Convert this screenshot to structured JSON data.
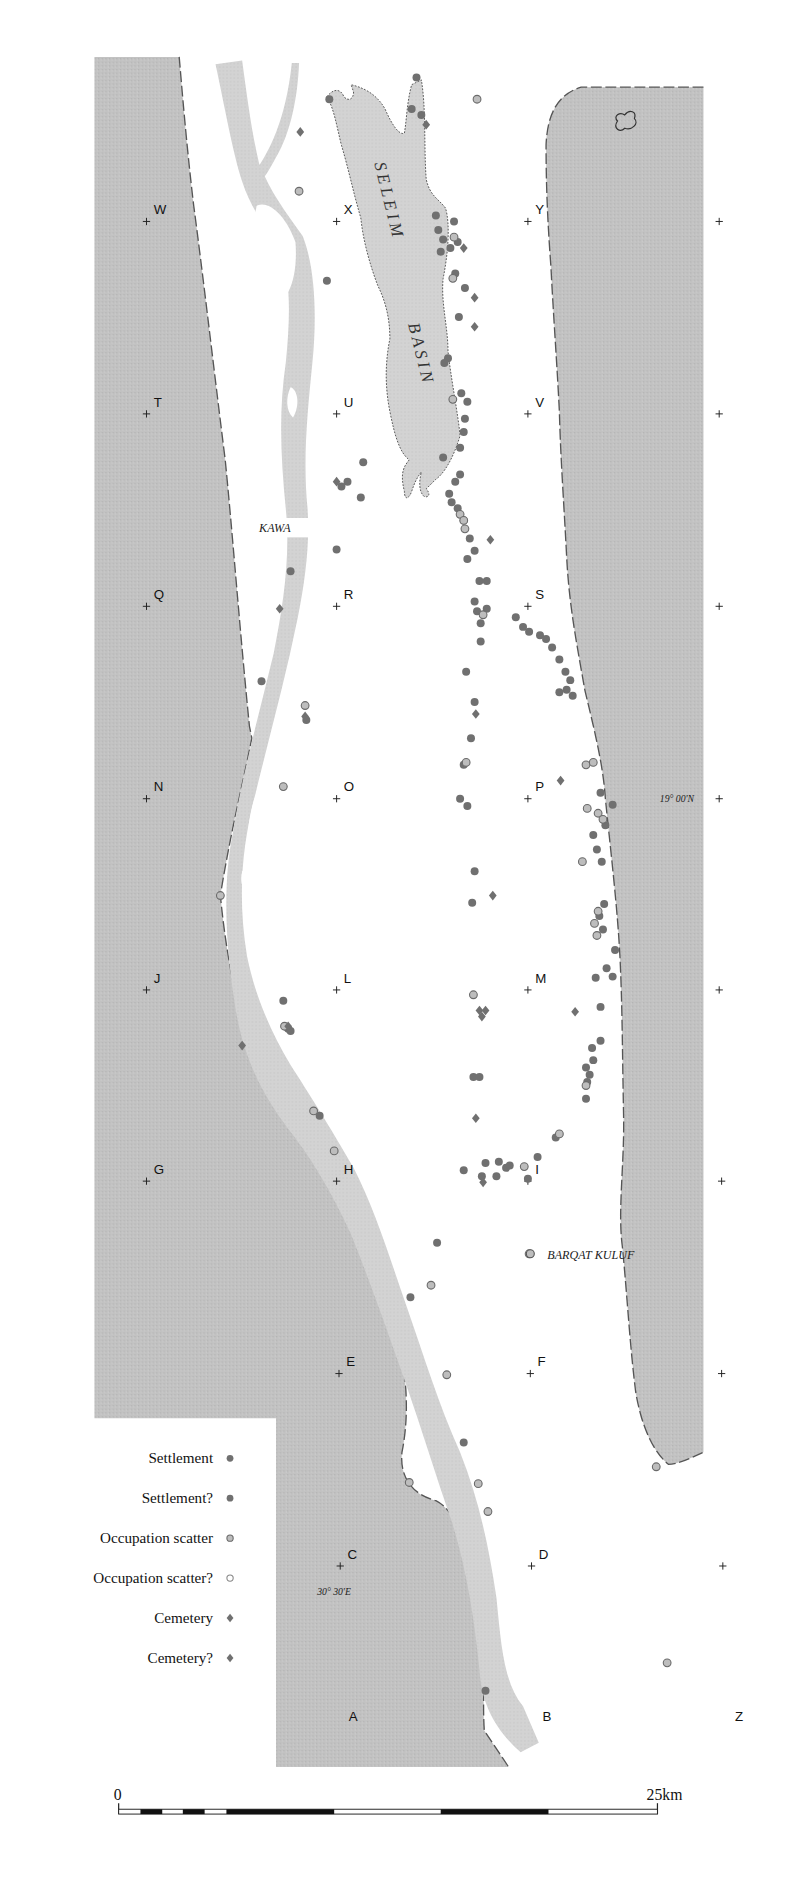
{
  "map": {
    "region_labels": {
      "basin_word1": "SELEIM",
      "basin_word2": "BASIN",
      "kawa": "KAWA",
      "barqat_kuluf": "BARQAT KULUF",
      "latitude": "19°  00'N",
      "longitude": "30°  30'E"
    },
    "grid_points": [
      {
        "id": "W",
        "x": 121,
        "y": 183
      },
      {
        "id": "X",
        "x": 278,
        "y": 183
      },
      {
        "id": "Y",
        "x": 436,
        "y": 183
      },
      {
        "id": "T",
        "x": 121,
        "y": 342
      },
      {
        "id": "U",
        "x": 278,
        "y": 342
      },
      {
        "id": "V",
        "x": 436,
        "y": 342
      },
      {
        "id": "Q",
        "x": 121,
        "y": 501
      },
      {
        "id": "R",
        "x": 278,
        "y": 501
      },
      {
        "id": "S",
        "x": 436,
        "y": 501
      },
      {
        "id": "N",
        "x": 121,
        "y": 660
      },
      {
        "id": "O",
        "x": 278,
        "y": 660
      },
      {
        "id": "P",
        "x": 436,
        "y": 660
      },
      {
        "id": "J",
        "x": 121,
        "y": 818
      },
      {
        "id": "L",
        "x": 278,
        "y": 818
      },
      {
        "id": "M",
        "x": 436,
        "y": 818
      },
      {
        "id": "G",
        "x": 121,
        "y": 976
      },
      {
        "id": "H",
        "x": 278,
        "y": 976
      },
      {
        "id": "I",
        "x": 436,
        "y": 976
      },
      {
        "id": "E",
        "x": 280,
        "y": 1135
      },
      {
        "id": "F",
        "x": 438,
        "y": 1135
      },
      {
        "id": "C",
        "x": 281,
        "y": 1294
      },
      {
        "id": "D",
        "x": 439,
        "y": 1294
      },
      {
        "id": "A",
        "x": 292,
        "y": 1418,
        "nocross": true
      },
      {
        "id": "B",
        "x": 452,
        "y": 1418,
        "nocross": true
      },
      {
        "id": "Z",
        "x": 611,
        "y": 1418,
        "nocross": true
      }
    ],
    "edge_crosses": [
      {
        "x": 594,
        "y": 183
      },
      {
        "x": 594,
        "y": 342
      },
      {
        "x": 594,
        "y": 501
      },
      {
        "x": 594,
        "y": 660
      },
      {
        "x": 594,
        "y": 818
      },
      {
        "x": 596,
        "y": 976
      },
      {
        "x": 596,
        "y": 1135
      },
      {
        "x": 597,
        "y": 1294
      }
    ],
    "sites": {
      "settlement": [
        [
          344,
          64
        ],
        [
          340,
          90
        ],
        [
          348,
          95
        ],
        [
          272,
          82
        ],
        [
          360,
          178
        ],
        [
          375,
          183
        ],
        [
          362,
          190
        ],
        [
          366,
          198
        ],
        [
          372,
          205
        ],
        [
          378,
          200
        ],
        [
          364,
          208
        ],
        [
          376,
          226
        ],
        [
          384,
          238
        ],
        [
          379,
          262
        ],
        [
          370,
          296
        ],
        [
          367,
          300
        ],
        [
          381,
          325
        ],
        [
          386,
          332
        ],
        [
          384,
          346
        ],
        [
          383,
          357
        ],
        [
          380,
          370
        ],
        [
          366,
          378
        ],
        [
          380,
          392
        ],
        [
          376,
          398
        ],
        [
          371,
          408
        ],
        [
          373,
          415
        ],
        [
          378,
          420
        ],
        [
          383,
          430
        ],
        [
          388,
          445
        ],
        [
          392,
          455
        ],
        [
          386,
          462
        ],
        [
          396,
          480
        ],
        [
          402,
          480
        ],
        [
          392,
          497
        ],
        [
          394,
          505
        ],
        [
          402,
          503
        ],
        [
          397,
          515
        ],
        [
          397,
          530
        ],
        [
          426,
          510
        ],
        [
          432,
          518
        ],
        [
          437,
          522
        ],
        [
          446,
          525
        ],
        [
          451,
          528
        ],
        [
          456,
          535
        ],
        [
          462,
          545
        ],
        [
          467,
          555
        ],
        [
          471,
          562
        ],
        [
          468,
          570
        ],
        [
          462,
          572
        ],
        [
          473,
          575
        ],
        [
          385,
          555
        ],
        [
          392,
          580
        ],
        [
          389,
          610
        ],
        [
          383,
          632
        ],
        [
          386,
          666
        ],
        [
          380,
          660
        ],
        [
          270,
          232
        ],
        [
          300,
          382
        ],
        [
          287,
          398
        ],
        [
          282,
          402
        ],
        [
          278,
          454
        ],
        [
          240,
          472
        ],
        [
          216,
          563
        ],
        [
          392,
          720
        ],
        [
          390,
          746
        ],
        [
          506,
          665
        ],
        [
          496,
          655
        ],
        [
          490,
          690
        ],
        [
          500,
          682
        ],
        [
          497,
          712
        ],
        [
          493,
          702
        ],
        [
          499,
          747
        ],
        [
          495,
          757
        ],
        [
          498,
          768
        ],
        [
          508,
          785
        ],
        [
          501,
          800
        ],
        [
          506,
          807
        ],
        [
          492,
          808
        ],
        [
          496,
          832
        ],
        [
          496,
          860
        ],
        [
          489,
          866
        ],
        [
          490,
          876
        ],
        [
          484,
          882
        ],
        [
          487,
          888
        ],
        [
          484,
          908
        ],
        [
          485,
          894
        ],
        [
          391,
          890
        ],
        [
          396,
          890
        ],
        [
          383,
          967
        ],
        [
          398,
          972
        ],
        [
          401,
          961
        ],
        [
          410,
          972
        ],
        [
          412,
          960
        ],
        [
          418,
          965
        ],
        [
          421,
          963
        ],
        [
          436,
          974
        ],
        [
          444,
          956
        ],
        [
          459,
          940
        ],
        [
          234,
          827
        ],
        [
          238,
          850
        ],
        [
          240,
          852
        ],
        [
          264,
          922
        ],
        [
          361,
          1027
        ],
        [
          339,
          1072
        ],
        [
          383,
          1192
        ],
        [
          401,
          1397
        ],
        [
          298,
          411
        ],
        [
          253,
          595
        ]
      ],
      "occupation_scatter": [
        [
          394,
          82
        ],
        [
          247,
          158
        ],
        [
          375,
          196
        ],
        [
          374,
          230
        ],
        [
          374,
          330
        ],
        [
          380,
          425
        ],
        [
          383,
          430
        ],
        [
          384,
          437
        ],
        [
          399,
          508
        ],
        [
          385,
          630
        ],
        [
          484,
          632
        ],
        [
          490,
          630
        ],
        [
          485,
          668
        ],
        [
          494,
          672
        ],
        [
          498,
          677
        ],
        [
          481,
          712
        ],
        [
          494,
          753
        ],
        [
          491,
          763
        ],
        [
          493,
          773
        ],
        [
          391,
          822
        ],
        [
          484,
          897
        ],
        [
          462,
          937
        ],
        [
          433,
          964
        ],
        [
          235,
          848
        ],
        [
          234,
          650
        ],
        [
          182,
          740
        ],
        [
          259,
          918
        ],
        [
          276,
          951
        ],
        [
          356,
          1062
        ],
        [
          369,
          1136
        ],
        [
          338,
          1225
        ],
        [
          395,
          1226
        ],
        [
          403,
          1249
        ],
        [
          542,
          1212
        ],
        [
          551,
          1374
        ],
        [
          252,
          583
        ],
        [
          437,
          1036
        ]
      ],
      "occupation_scatter_uncertain": [],
      "cemetery": [
        [
          248,
          109
        ],
        [
          352,
          103
        ],
        [
          383,
          205
        ],
        [
          392,
          246
        ],
        [
          392,
          270
        ],
        [
          405,
          446
        ],
        [
          407,
          740
        ],
        [
          463,
          645
        ],
        [
          393,
          590
        ],
        [
          396,
          835
        ],
        [
          398,
          840
        ],
        [
          401,
          835
        ],
        [
          231,
          503
        ],
        [
          278,
          398
        ],
        [
          252,
          592
        ],
        [
          200,
          864
        ],
        [
          238,
          848
        ],
        [
          399,
          977
        ],
        [
          393,
          924
        ],
        [
          475,
          836
        ]
      ]
    }
  },
  "legend": {
    "items": [
      {
        "label": "Settlement",
        "symbol": "settlement"
      },
      {
        "label": "Settlement?",
        "symbol": "settlement_uncertain"
      },
      {
        "label": "Occupation scatter",
        "symbol": "occupation_scatter"
      },
      {
        "label": "Occupation scatter?",
        "symbol": "occupation_scatter_uncertain"
      },
      {
        "label": "Cemetery",
        "symbol": "cemetery"
      },
      {
        "label": "Cemetery?",
        "symbol": "cemetery_uncertain"
      }
    ]
  },
  "scale_bar": {
    "start_label": "0",
    "end_label": "25km"
  },
  "colors": {
    "desert": "#c4c4c4",
    "river": "#d4d4d4",
    "basin": "#d8d8d8",
    "settlement": "#707070",
    "scatter_fill": "#bdbdbd",
    "scatter_stroke": "#6a6a6a",
    "escarpment": "#555555"
  }
}
